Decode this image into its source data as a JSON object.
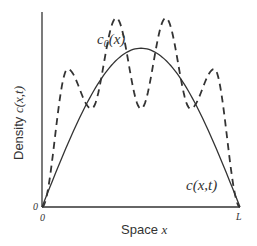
{
  "chart_data": {
    "type": "line",
    "title": "",
    "xlabel": "Space x",
    "ylabel": "Density c(x,t)",
    "x_ticks": [
      "0",
      "L"
    ],
    "y_ticks": [
      "0"
    ],
    "grid": false,
    "legend": "inline labels",
    "series": [
      {
        "name": "c0(x)",
        "style": "dashed",
        "description": "Initial density: oscillating profile with 4 peaks (outer two lower, inner two higher) and 3 troughs",
        "x": [
          0.0,
          0.13,
          0.25,
          0.375,
          0.5,
          0.625,
          0.75,
          0.87,
          1.0
        ],
        "y": [
          0.0,
          0.73,
          0.52,
          1.0,
          0.52,
          1.0,
          0.52,
          0.73,
          0.0
        ]
      },
      {
        "name": "c(x,t)",
        "style": "solid",
        "description": "Smoothed density at later time: single hump (parabola-like) zero at 0 and L",
        "x": [
          0.0,
          0.125,
          0.25,
          0.375,
          0.5,
          0.625,
          0.75,
          0.875,
          1.0
        ],
        "y": [
          0.0,
          0.41,
          0.7,
          0.88,
          0.85,
          0.88,
          0.7,
          0.41,
          0.0
        ]
      }
    ],
    "annotations": [
      {
        "text": "c0(x)",
        "near": "dashed curve, upper left"
      },
      {
        "text": "c(x,t)",
        "near": "solid curve, lower right"
      }
    ]
  },
  "labels": {
    "c0_main": "c",
    "c0_sub": "0",
    "c0_arg": "(x)",
    "ct": "c(x,t)",
    "xlabel_word": "Space ",
    "xlabel_var": "x",
    "ylabel_word": "Density ",
    "ylabel_var": "c(x,t)",
    "origin_y": "0",
    "origin_x": "0",
    "end_x": "L"
  }
}
